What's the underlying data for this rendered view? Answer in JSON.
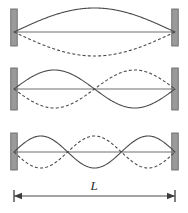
{
  "figure": {
    "background_color": "#ffffff",
    "width": 188,
    "height": 213,
    "curve_color": "#4a4a4a",
    "axis_color": "#6f6f6f",
    "support_fill": "#9a9a9a",
    "support_stroke": "#6a6a6a",
    "label_color": "#2b2b2b"
  },
  "geometry": {
    "string_left_x": 14,
    "string_right_x": 175,
    "support_width": 6.5
  },
  "harmonics": [
    {
      "name": "first-harmonic",
      "mode_number": 1,
      "antinodes": 1,
      "nodes": 2,
      "axis_y": 32,
      "amplitude": 24,
      "support_top": 9,
      "support_bottom": 46,
      "solid_phase": "positive",
      "dashed_phase": "negative"
    },
    {
      "name": "second-harmonic",
      "mode_number": 2,
      "antinodes": 2,
      "nodes": 3,
      "axis_y": 89,
      "amplitude": 19,
      "support_top": 68,
      "support_bottom": 110,
      "solid_phase": "positive",
      "dashed_phase": "negative"
    },
    {
      "name": "third-harmonic",
      "mode_number": 3,
      "antinodes": 3,
      "nodes": 4,
      "axis_y": 152,
      "amplitude": 16,
      "support_top": 133,
      "support_bottom": 170,
      "solid_phase": "positive",
      "dashed_phase": "negative"
    }
  ],
  "dimension": {
    "name": "length-dimension",
    "label": "L",
    "line_y": 196,
    "left_x": 14,
    "right_x": 175,
    "tick_half_height": 6,
    "arrow_length": 8,
    "arrow_half_width": 3.2,
    "label_x": 94,
    "label_y": 190
  }
}
